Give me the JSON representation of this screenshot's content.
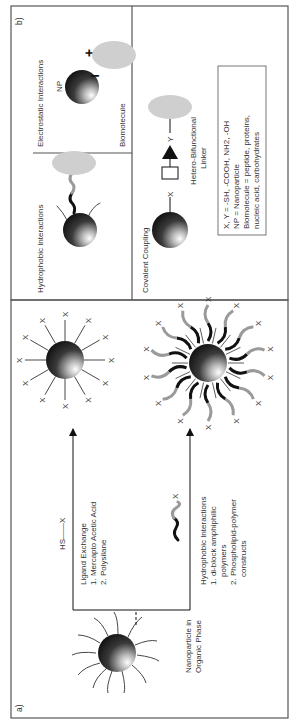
{
  "panel_a": {
    "label": "a)",
    "start_label_line1": "Nanoparticle in",
    "start_label_line2": "Organic Phase",
    "ligand_exchange": {
      "reagent": "HS——X",
      "title": "Ligand Exchange",
      "item1": "1. Mercapto Acetic Acid",
      "item2": "2. Polysilane"
    },
    "hydrophobic": {
      "reagent_end": "X",
      "title": "Hydrophobic Interactions",
      "item1a": "1. di-block amphiphilic",
      "item1b": "polymers",
      "item2a": "2. Phospholipid-polymer",
      "item2b": "constructs"
    },
    "terminal_group": "X"
  },
  "panel_b": {
    "label": "b)",
    "electrostatic": {
      "title": "Electrostatic Interactions",
      "np_label": "NP",
      "minus": "−",
      "plus": "+",
      "biomolecule_label": "Biomolecule"
    },
    "hydrophobic": {
      "title": "Hydrophobic Interactions"
    },
    "covalent": {
      "title": "Covalent Coupling",
      "x_label": "X",
      "y_label": "Y",
      "linker_line1": "Hetero-Bifunctional",
      "linker_line2": "Linker"
    },
    "legend": {
      "line1": "X, Y = -SH, -COOH, NH2, -OH",
      "line2": "NP = Nanoparticle",
      "line3": "Biomolecule = peptide, proteins,",
      "line4": "nucleic acid, carbohydrates"
    }
  },
  "colors": {
    "frame": "#555555",
    "biomolecule": "#cfcfcf",
    "polymer_dark": "#111111",
    "polymer_light": "#9a9a9a"
  }
}
